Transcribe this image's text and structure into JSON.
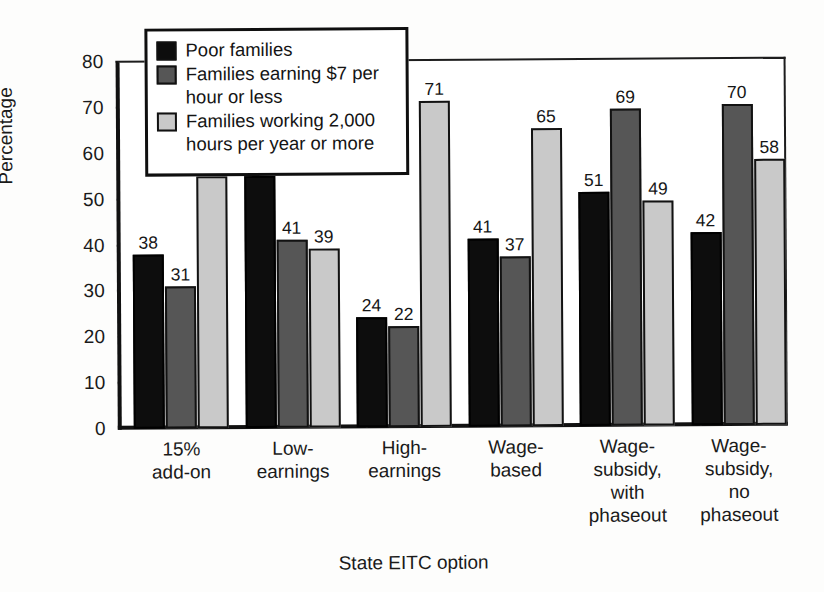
{
  "chart_data": {
    "type": "bar",
    "title": "",
    "xlabel": "State EITC option",
    "ylabel": "Percentage",
    "ylim": [
      0,
      80
    ],
    "ytick_step": 10,
    "yticks": [
      0,
      10,
      20,
      30,
      40,
      50,
      60,
      70,
      80
    ],
    "grid": false,
    "legend_position": "top-left",
    "categories": [
      "15%\nadd-on",
      "Low-\nearnings",
      "High-\nearnings",
      "Wage-\nbased",
      "Wage-\nsubsidy,\nwith\nphaseout",
      "Wage-\nsubsidy,\nno\nphaseout"
    ],
    "series": [
      {
        "name": "Poor families",
        "color": "#0d0d0d",
        "values": [
          38,
          55,
          24,
          41,
          51,
          42
        ]
      },
      {
        "name": "Families earning $7 per hour or less",
        "color": "#565656",
        "values": [
          31,
          41,
          22,
          37,
          69,
          70
        ]
      },
      {
        "name": "Families working 2,000 hours per year or more",
        "color": "#c9c9c9",
        "values": [
          55,
          39,
          71,
          65,
          49,
          58
        ]
      }
    ]
  },
  "legend": {
    "items": [
      "Poor families",
      "Families earning $7 per\nhour or less",
      "Families working 2,000\nhours per year or more"
    ]
  }
}
